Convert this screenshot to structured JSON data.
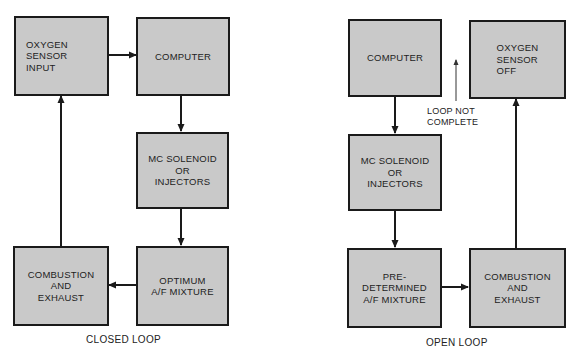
{
  "closed_loop": {
    "caption": "CLOSED LOOP",
    "boxes": {
      "oxygen_sensor": "OXYGEN\nSENSOR\nINPUT",
      "computer": "COMPUTER",
      "mc_solenoid": "MC SOLENOID\nOR\nINJECTORS",
      "optimum_mixture": "OPTIMUM\nA/F MIXTURE",
      "combustion": "COMBUSTION\nAND\nEXHAUST"
    }
  },
  "open_loop": {
    "caption": "OPEN LOOP",
    "note": "LOOP NOT\nCOMPLETE",
    "boxes": {
      "computer": "COMPUTER",
      "oxygen_sensor": "OXYGEN\nSENSOR\nOFF",
      "mc_solenoid": "MC SOLENOID\nOR\nINJECTORS",
      "predetermined_mixture": "PRE-\nDETERMINED\nA/F MIXTURE",
      "combustion": "COMBUSTION\nAND\nEXHAUST"
    }
  },
  "colors": {
    "box_fill": "#c9c9c9",
    "line": "#1a1a1a"
  }
}
